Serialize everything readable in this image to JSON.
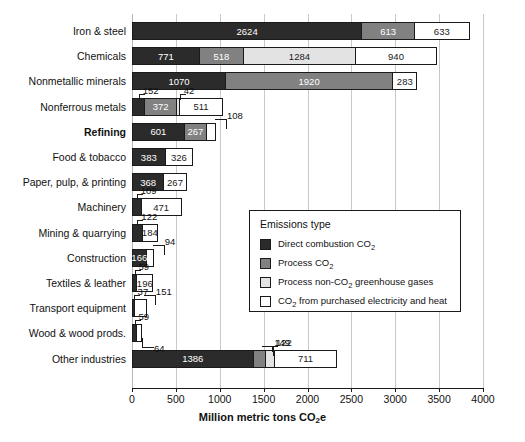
{
  "chart_data": {
    "type": "bar",
    "orientation": "horizontal",
    "stacked": true,
    "title": "",
    "xlabel": "Million metric tons CO2e",
    "ylabel": "",
    "xlim": [
      0,
      4000
    ],
    "xticks": [
      0,
      500,
      1000,
      1500,
      2000,
      2500,
      3000,
      3500,
      4000
    ],
    "xticklabels": [
      "0",
      "500",
      "1000",
      "1500",
      "2000",
      "2500",
      "3000",
      "3500",
      "4000"
    ],
    "grid": true,
    "legend_position": "center-right-inset",
    "legend_title": "Emissions type",
    "series": [
      {
        "name": "Direct combustion CO2",
        "color": "#2b2b2b",
        "values": [
          2624,
          771,
          1070,
          152,
          601,
          383,
          368,
          109,
          122,
          166,
          59,
          37,
          59,
          1386
        ]
      },
      {
        "name": "Process CO2",
        "color": "#818181",
        "values": [
          613,
          518,
          1920,
          372,
          267,
          0,
          0,
          0,
          0,
          0,
          0,
          0,
          0,
          149
        ]
      },
      {
        "name": "Process non-CO2 greenhouse gases",
        "color": "#e3e3e3",
        "values": [
          0,
          1284,
          0,
          42,
          0,
          0,
          0,
          0,
          0,
          0,
          0,
          0,
          0,
          122
        ]
      },
      {
        "name": "CO2 from purchased electricity and heat",
        "color": "#ffffff",
        "values": [
          633,
          940,
          283,
          511,
          108,
          326,
          267,
          471,
          184,
          94,
          196,
          151,
          64,
          711
        ]
      }
    ],
    "categories": [
      "Iron & steel",
      "Chemicals",
      "Nonmetallic minerals",
      "Nonferrous metals",
      "Refining",
      "Food & tobacco",
      "Paper, pulp, & printing",
      "Machinery",
      "Mining & quarrying",
      "Construction",
      "Textiles & leather",
      "Transport equipment",
      "Wood & wood prods.",
      "Other industries"
    ]
  },
  "axis": {
    "title_main": "Million metric tons CO",
    "title_sub": "2",
    "title_tail": "e",
    "ticks": [
      {
        "label": "0"
      },
      {
        "label": "500"
      },
      {
        "label": "1000"
      },
      {
        "label": "1500"
      },
      {
        "label": "2000"
      },
      {
        "label": "2500"
      },
      {
        "label": "3000"
      },
      {
        "label": "3500"
      },
      {
        "label": "4000"
      }
    ]
  },
  "legend": {
    "title": "Emissions type",
    "items": [
      {
        "label_pre": "Direct combustion CO",
        "label_sub": "2",
        "label_post": ""
      },
      {
        "label_pre": "Process CO",
        "label_sub": "2",
        "label_post": ""
      },
      {
        "label_pre": "Process non-CO",
        "label_sub": "2",
        "label_post": " greenhouse gases"
      },
      {
        "label_pre": "CO",
        "label_sub": "2",
        "label_post": " from purchased electricity and heat"
      }
    ]
  },
  "rows": [
    {
      "label": "Iron & steel",
      "bold": false,
      "segments": [
        {
          "type": "direct",
          "value": 2624,
          "inside": true
        },
        {
          "type": "process",
          "value": 613,
          "inside": true
        },
        {
          "type": "elec",
          "value": 633,
          "inside": true
        }
      ]
    },
    {
      "label": "Chemicals",
      "bold": false,
      "segments": [
        {
          "type": "direct",
          "value": 771,
          "inside": true
        },
        {
          "type": "process",
          "value": 518,
          "inside": true
        },
        {
          "type": "nonco2",
          "value": 1284,
          "inside": true
        },
        {
          "type": "elec",
          "value": 940,
          "inside": true
        }
      ]
    },
    {
      "label": "Nonmetallic minerals",
      "bold": false,
      "segments": [
        {
          "type": "direct",
          "value": 1070,
          "inside": true
        },
        {
          "type": "process",
          "value": 1920,
          "inside": true
        },
        {
          "type": "elec",
          "value": 283,
          "inside": true
        }
      ]
    },
    {
      "label": "Nonferrous metals",
      "bold": false,
      "segments": [
        {
          "type": "direct",
          "value": 152,
          "inside": false,
          "callout": "up-left"
        },
        {
          "type": "process",
          "value": 372,
          "inside": true
        },
        {
          "type": "nonco2",
          "value": 42,
          "inside": false,
          "callout": "up-left"
        },
        {
          "type": "elec",
          "value": 511,
          "inside": true
        }
      ]
    },
    {
      "label": "Refining",
      "bold": true,
      "segments": [
        {
          "type": "direct",
          "value": 601,
          "inside": true
        },
        {
          "type": "process",
          "value": 267,
          "inside": true
        },
        {
          "type": "elec",
          "value": 108,
          "inside": false,
          "callout": "up-right"
        }
      ]
    },
    {
      "label": "Food & tobacco",
      "bold": false,
      "segments": [
        {
          "type": "direct",
          "value": 383,
          "inside": true
        },
        {
          "type": "elec",
          "value": 326,
          "inside": true
        }
      ]
    },
    {
      "label": "Paper, pulp, & printing",
      "bold": false,
      "segments": [
        {
          "type": "direct",
          "value": 368,
          "inside": true
        },
        {
          "type": "elec",
          "value": 267,
          "inside": true
        }
      ]
    },
    {
      "label": "Machinery",
      "bold": false,
      "segments": [
        {
          "type": "direct",
          "value": 109,
          "inside": false,
          "callout": "up-left"
        },
        {
          "type": "elec",
          "value": 471,
          "inside": true
        }
      ]
    },
    {
      "label": "Mining & quarrying",
      "bold": false,
      "segments": [
        {
          "type": "direct",
          "value": 122,
          "inside": false,
          "callout": "up-left"
        },
        {
          "type": "elec",
          "value": 184,
          "inside": true
        }
      ]
    },
    {
      "label": "Construction",
      "bold": false,
      "segments": [
        {
          "type": "direct",
          "value": 166,
          "inside": true
        },
        {
          "type": "elec",
          "value": 94,
          "inside": false,
          "callout": "up-right"
        }
      ]
    },
    {
      "label": "Textiles & leather",
      "bold": false,
      "segments": [
        {
          "type": "direct",
          "value": 59,
          "inside": false,
          "callout": "up-left"
        },
        {
          "type": "elec",
          "value": 196,
          "inside": true
        }
      ]
    },
    {
      "label": "Transport equipment",
      "bold": false,
      "segments": [
        {
          "type": "direct",
          "value": 37,
          "inside": false,
          "callout": "up-left"
        },
        {
          "type": "elec",
          "value": 151,
          "inside": false,
          "callout": "up-right"
        }
      ]
    },
    {
      "label": "Wood & wood prods.",
      "bold": false,
      "segments": [
        {
          "type": "direct",
          "value": 59,
          "inside": false,
          "callout": "up-left"
        },
        {
          "type": "elec",
          "value": 64,
          "inside": false,
          "callout": "down-right"
        }
      ]
    },
    {
      "label": "Other industries",
      "bold": false,
      "segments": [
        {
          "type": "direct",
          "value": 1386,
          "inside": true
        },
        {
          "type": "process",
          "value": 149,
          "inside": false,
          "callout": "up-right"
        },
        {
          "type": "nonco2",
          "value": 122,
          "inside": false,
          "callout": "up-left"
        },
        {
          "type": "elec",
          "value": 711,
          "inside": true
        }
      ]
    }
  ]
}
